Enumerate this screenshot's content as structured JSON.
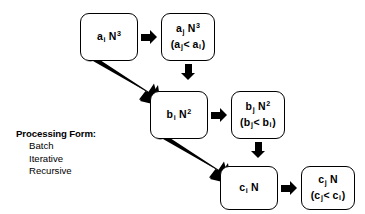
{
  "diagram": {
    "colors": {
      "stroke": "#000000",
      "background": "#ffffff",
      "arrow": "#000000"
    },
    "boxes": [
      {
        "id": "a-i-n3",
        "name": "box-ai-n-cubed",
        "coefficient": "a",
        "coefficient_subscript": "i",
        "term": "N",
        "exponent": "3",
        "has_condition": false,
        "condition": ""
      },
      {
        "id": "a-j-n3",
        "name": "box-aj-n-cubed",
        "coefficient": "a",
        "coefficient_subscript": "j",
        "term": "N",
        "exponent": "3",
        "has_condition": true,
        "condition_left": "a",
        "condition_left_sub": "j",
        "condition_op": "<",
        "condition_right": "a",
        "condition_right_sub": "i"
      },
      {
        "id": "b-i-n2",
        "name": "box-bi-n-squared",
        "coefficient": "b",
        "coefficient_subscript": "i",
        "term": "N",
        "exponent": "2",
        "has_condition": false,
        "condition": ""
      },
      {
        "id": "b-j-n2",
        "name": "box-bj-n-squared",
        "coefficient": "b",
        "coefficient_subscript": "j",
        "term": "N",
        "exponent": "2",
        "has_condition": true,
        "condition_left": "b",
        "condition_left_sub": "j",
        "condition_op": "<",
        "condition_right": "b",
        "condition_right_sub": "i"
      },
      {
        "id": "c-i-n",
        "name": "box-ci-n",
        "coefficient": "c",
        "coefficient_subscript": "i",
        "term": "N",
        "exponent": "",
        "has_condition": false,
        "condition": ""
      },
      {
        "id": "c-j-n",
        "name": "box-cj-n",
        "coefficient": "c",
        "coefficient_subscript": "j",
        "term": "N",
        "exponent": "",
        "has_condition": true,
        "condition_left": "c",
        "condition_left_sub": "j",
        "condition_op": "<",
        "condition_right": "c",
        "condition_right_sub": "i"
      }
    ],
    "arrows": [
      {
        "name": "arrow-ai-to-aj",
        "direction": "right"
      },
      {
        "name": "arrow-aj-to-bi",
        "direction": "down"
      },
      {
        "name": "arrow-ai-to-bi",
        "direction": "diagonal-down-right"
      },
      {
        "name": "arrow-bi-to-bj",
        "direction": "right"
      },
      {
        "name": "arrow-bj-to-ci",
        "direction": "down"
      },
      {
        "name": "arrow-bi-to-ci",
        "direction": "diagonal-down-right"
      },
      {
        "name": "arrow-ci-to-cj",
        "direction": "right"
      }
    ]
  },
  "legend": {
    "title": "Processing Form:",
    "items": [
      {
        "label": "Batch"
      },
      {
        "label": "Iterative"
      },
      {
        "label": "Recursive"
      }
    ]
  }
}
